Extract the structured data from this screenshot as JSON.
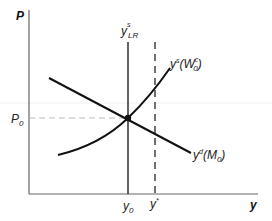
{
  "diagram": {
    "type": "economics-AS-AD",
    "axes": {
      "y_label": "P",
      "x_label": "y"
    },
    "price_level_label": {
      "base": "P",
      "sub": "0"
    },
    "output_labels": {
      "y0": {
        "base": "y",
        "sub": "0"
      },
      "ystar": {
        "base": "y",
        "sup": "*"
      }
    },
    "curves": {
      "long_run_supply": {
        "base": "y",
        "sup": "s",
        "sub": "LR"
      },
      "short_run_supply": {
        "base": "y",
        "sup": "s",
        "paren_open": "(W",
        "paren_sup": "c",
        "paren_sub": "0",
        "paren_close": ")"
      },
      "demand": {
        "base": "y",
        "sup": "d",
        "paren_open": "(M",
        "paren_sub": "0",
        "paren_close": ")"
      }
    },
    "colors": {
      "axis": "#666666",
      "curve": "#111111",
      "guide_dashed": "#bbbbbb",
      "vertical_dashed": "#333333",
      "background": "#ffffff"
    }
  }
}
